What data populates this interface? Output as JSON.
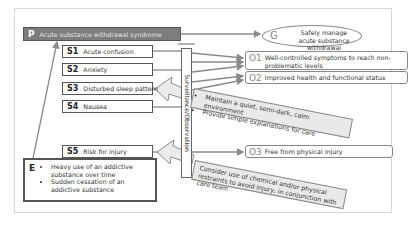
{
  "problem": {
    "code": "P",
    "label": "Acute substance withdrawal syndrome"
  },
  "goal": {
    "code": "G",
    "label": "Safely manage acute substance withdrawal"
  },
  "symptoms": [
    {
      "code": "S1",
      "label": "Acute confusion"
    },
    {
      "code": "S2",
      "label": "Anxiety"
    },
    {
      "code": "S3",
      "label": "Disturbed sleep pattern"
    },
    {
      "code": "S4",
      "label": "Nausea"
    },
    {
      "code": "S5",
      "label": "Risk for injury"
    }
  ],
  "surveillance": {
    "label": "Surveillance/Observation"
  },
  "outcomes": [
    {
      "code": "O1",
      "label": "Well-controlled symptoms to reach non-problematic levels"
    },
    {
      "code": "O2",
      "label": "Improved health and functional status"
    },
    {
      "code": "O3",
      "label": "Free from physical injury"
    }
  ],
  "interventions": [
    {
      "items": [
        "Maintain a quiet, semi-dark, calm environment",
        "Provide simple explanations for care"
      ]
    },
    {
      "text": "Consider use of chemical and/or physical restraints to avoid injury, in conjunction with care team"
    }
  ],
  "etiology": {
    "code": "E",
    "items": [
      "Heavy use of an addictive substance over time",
      "Sudden cessation of an addictive substance"
    ]
  },
  "colors": {
    "problem_fill": "#7d7d7d",
    "line": "#8a8a8a",
    "intervention_fill": "#e9e9e9"
  }
}
